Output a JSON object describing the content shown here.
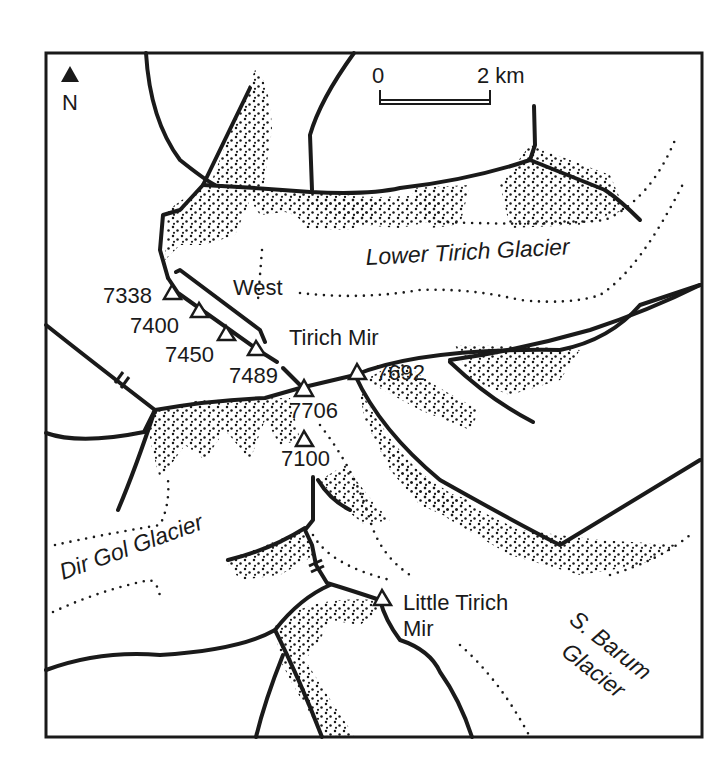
{
  "map": {
    "north_arrow": {
      "label": "N"
    },
    "scale_bar": {
      "start_label": "0",
      "end_label": "2 km"
    },
    "glaciers": [
      {
        "name": "Lower Tirich Glacier"
      },
      {
        "name": "Dir Gol Glacier"
      },
      {
        "name": "S. Barum Glacier",
        "line1": "S. Barum",
        "line2": "Glacier"
      }
    ],
    "features": {
      "west_label": "West",
      "tirich_mir_label": "Tirich Mir",
      "little_tirich_line1": "Little Tirich",
      "little_tirich_line2": "Mir"
    },
    "peaks": [
      {
        "elevation": "7338"
      },
      {
        "elevation": "7400"
      },
      {
        "elevation": "7450"
      },
      {
        "elevation": "7489"
      },
      {
        "elevation": "7706"
      },
      {
        "elevation": "7692"
      },
      {
        "elevation": "7100"
      }
    ],
    "colors": {
      "ink": "#1a1a1a",
      "paper": "#ffffff"
    }
  }
}
